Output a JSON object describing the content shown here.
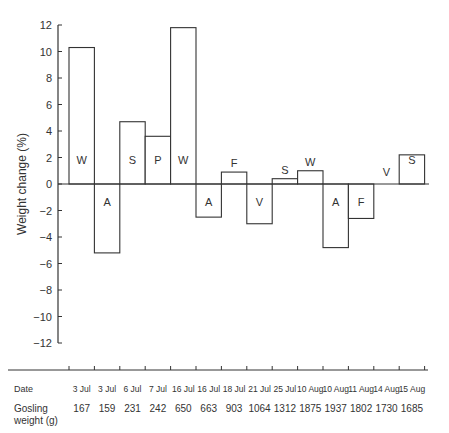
{
  "chart_data": {
    "type": "bar",
    "title": "",
    "xlabel": "",
    "ylabel": "Weight change (%)",
    "ylim": [
      -12,
      12
    ],
    "yticks": [
      12,
      10,
      8,
      6,
      4,
      2,
      0,
      -2,
      -4,
      -6,
      -8,
      -10,
      -12
    ],
    "grid": false,
    "categories": [
      "W",
      "A",
      "S",
      "P",
      "W",
      "A",
      "F",
      "V",
      "S",
      "W",
      "A",
      "F",
      "V",
      "S"
    ],
    "values": [
      10.3,
      -5.2,
      4.7,
      3.6,
      11.8,
      -2.5,
      0.9,
      -3.0,
      0.4,
      1.0,
      -4.8,
      -2.6,
      0.0,
      2.2
    ],
    "table": {
      "date_label": "Date",
      "weight_label_line1": "Gosling",
      "weight_label_line2": "weight (g)",
      "dates": [
        "3 Jul",
        "3 Jul",
        "6 Jul",
        "7 Jul",
        "16 Jul",
        "16 Jul",
        "18 Jul",
        "21 Jul",
        "25 Jul",
        "10 Aug",
        "10 Aug",
        "11 Aug",
        "14 Aug",
        "15 Aug"
      ],
      "weights": [
        167,
        159,
        231,
        242,
        650,
        663,
        903,
        1064,
        1312,
        1875,
        1937,
        1802,
        1730,
        1685
      ]
    }
  }
}
